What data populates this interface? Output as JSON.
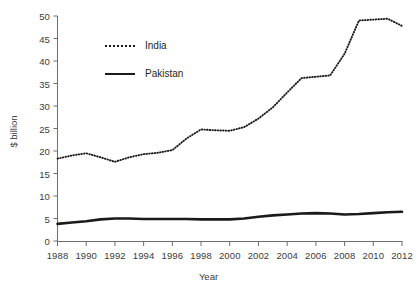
{
  "chart_data": {
    "type": "line",
    "title": "",
    "xlabel": "Year",
    "ylabel": "$ billion",
    "xlim": [
      1988,
      2012
    ],
    "ylim": [
      0,
      50
    ],
    "grid": false,
    "legend_position": "upper-left-inside",
    "y_ticks": [
      0,
      5,
      10,
      15,
      20,
      25,
      30,
      35,
      40,
      45,
      50
    ],
    "x_ticks": [
      1988,
      1990,
      1992,
      1994,
      1996,
      1998,
      2000,
      2002,
      2004,
      2006,
      2008,
      2010,
      2012
    ],
    "x": [
      1988,
      1989,
      1990,
      1991,
      1992,
      1993,
      1994,
      1995,
      1996,
      1997,
      1998,
      1999,
      2000,
      2001,
      2002,
      2003,
      2004,
      2005,
      2006,
      2007,
      2008,
      2009,
      2010,
      2011,
      2012
    ],
    "series": [
      {
        "name": "India",
        "style": "dotted",
        "color": "#1a1a1a",
        "values": [
          18.3,
          19.0,
          19.5,
          18.6,
          17.6,
          18.6,
          19.3,
          19.6,
          20.2,
          22.8,
          24.8,
          24.6,
          24.5,
          25.3,
          27.2,
          29.7,
          33.0,
          36.2,
          36.5,
          36.8,
          41.6,
          49.0,
          49.2,
          49.4,
          47.8
        ]
      },
      {
        "name": "Pakistan",
        "style": "solid",
        "color": "#1a1a1a",
        "values": [
          3.8,
          4.1,
          4.4,
          4.8,
          5.0,
          5.0,
          4.9,
          4.9,
          4.9,
          4.9,
          4.8,
          4.8,
          4.8,
          5.0,
          5.4,
          5.7,
          5.9,
          6.1,
          6.2,
          6.1,
          5.9,
          6.0,
          6.2,
          6.4,
          6.5
        ]
      }
    ]
  },
  "axis_titles": {
    "x": "Year",
    "y": "$ billion"
  },
  "legend": {
    "items": [
      {
        "label": "India"
      },
      {
        "label": "Pakistan"
      }
    ]
  }
}
